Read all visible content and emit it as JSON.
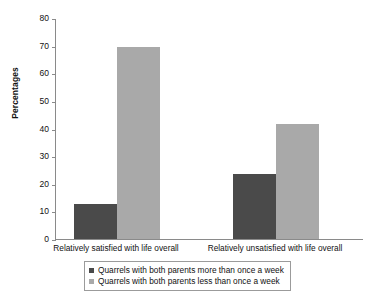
{
  "chart_data": {
    "type": "bar",
    "title": "",
    "xlabel": "",
    "ylabel": "Percentages",
    "ylim": [
      0,
      80
    ],
    "yticks": [
      0,
      10,
      20,
      30,
      40,
      50,
      60,
      70,
      80
    ],
    "ytick_labels": [
      "0",
      "10",
      "20",
      "30",
      "40",
      "50",
      "60",
      "70",
      "80"
    ],
    "grid": false,
    "legend_position": "bottom",
    "categories": [
      "Relatively satisfied with life overall",
      "Relatively unsatisfied with life overall"
    ],
    "series": [
      {
        "name": "Quarrels with both parents more than once a week",
        "color": "#4a4a4a",
        "values": [
          12.5,
          23.5
        ]
      },
      {
        "name": "Quarrels with both parents less than once a week",
        "color": "#a9a9a9",
        "values": [
          69.5,
          41.5
        ]
      }
    ]
  },
  "legend": {
    "items": [
      {
        "label": "Quarrels with both parents more than once a week"
      },
      {
        "label": "Quarrels with both parents less than once a week"
      }
    ]
  }
}
